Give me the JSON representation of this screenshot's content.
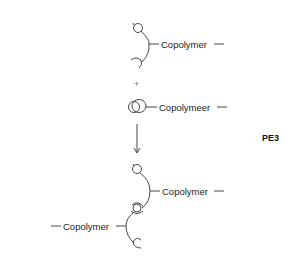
{
  "diagram": {
    "id_label": "PE3",
    "reactant_1": {
      "label": "Copolymer"
    },
    "operator": "+",
    "reactant_2": {
      "label": "Copolymeer"
    },
    "arrow": "down",
    "product": {
      "right_label": "Copolymer",
      "left_label": "Copolymer"
    }
  }
}
